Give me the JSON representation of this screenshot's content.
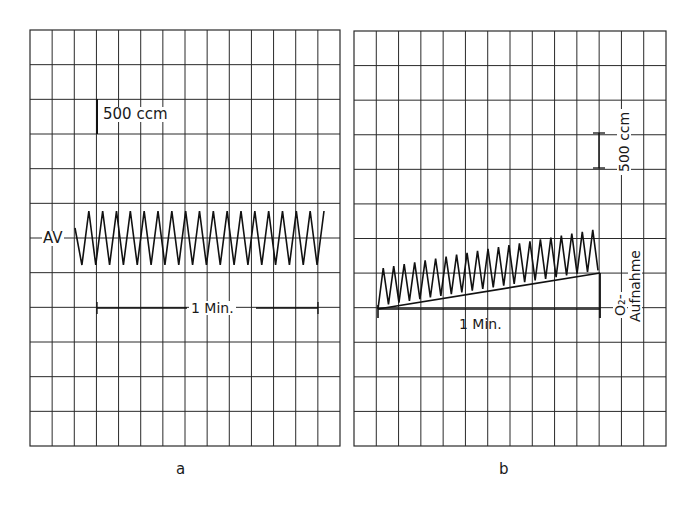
{
  "figure": {
    "panels": [
      {
        "id": "a",
        "caption": "a",
        "scale_label": "500 ccm",
        "trace_label": "AV",
        "time_label": "1 Min."
      },
      {
        "id": "b",
        "caption": "b",
        "scale_label": "500 ccm",
        "trace_label_line1": "O₂-",
        "trace_label_line2": "Aufnahme",
        "time_label": "1 Min."
      }
    ]
  },
  "colors": {
    "background": "#ffffff",
    "grid": "#2a2a2a",
    "trace": "#111111"
  },
  "diagram_data": {
    "type": "spirogram",
    "panels": [
      {
        "id": "a",
        "description": "Constant-baseline breathing oscillation (AV), ~18 cycles within 1 minute",
        "breaths_per_min": 18,
        "baseline_drift": 0,
        "scale_bar_ccm": 500
      },
      {
        "id": "b",
        "description": "Breathing oscillation with rising baseline indicating O2 uptake, ~21 cycles within 1 minute",
        "breaths_per_min": 21,
        "baseline_drift": "rising",
        "scale_bar_ccm": 500
      }
    ]
  }
}
